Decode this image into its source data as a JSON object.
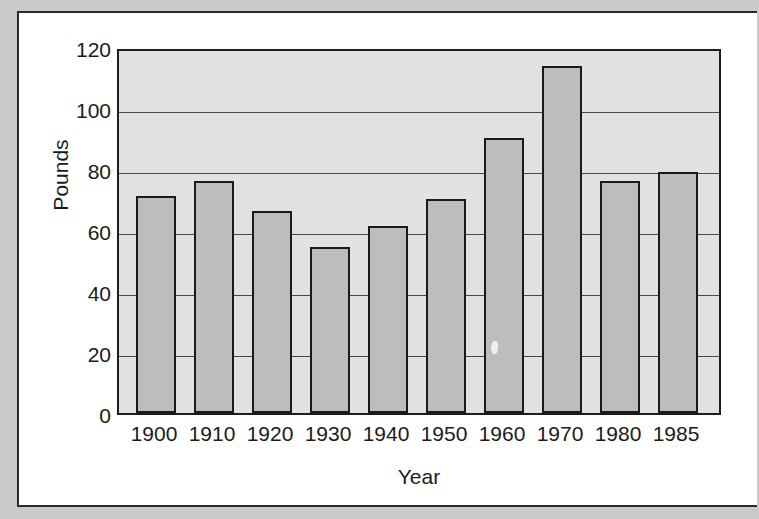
{
  "figure": {
    "background_color": "#c9c9c7",
    "page_color": "#ffffff",
    "frame_color": "#2b2b2b"
  },
  "chart_data": {
    "type": "bar",
    "title": "",
    "subtitle": "",
    "xlabel": "Year",
    "ylabel": "Pounds",
    "categories": [
      "1900",
      "1910",
      "1920",
      "1930",
      "1940",
      "1950",
      "1960",
      "1970",
      "1980",
      "1985"
    ],
    "values": [
      72,
      77,
      67,
      55,
      62,
      71,
      91,
      115,
      77,
      80
    ],
    "series": [
      {
        "name": "Pounds",
        "values": [
          72,
          77,
          67,
          55,
          62,
          71,
          91,
          115,
          77,
          80
        ]
      }
    ],
    "ylim": [
      0,
      120
    ],
    "y_ticks": [
      0,
      20,
      40,
      60,
      80,
      100,
      120
    ],
    "y_tick_labels": [
      "0",
      "20",
      "40",
      "60",
      "80",
      "100",
      "120"
    ],
    "x_tick_labels": [
      "1900",
      "1910",
      "1920",
      "1930",
      "1940",
      "1950",
      "1960",
      "1970",
      "1980",
      "1985"
    ],
    "grid": true,
    "grid_axis": "y",
    "legend": false,
    "legend_position": "none",
    "bar_fill_color": "#bdbdbb",
    "bar_edge_color": "#1a1a1a",
    "plot_background_color": "#e2e2e0",
    "annotations": []
  }
}
